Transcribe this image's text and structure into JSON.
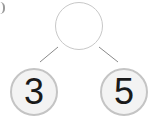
{
  "diagram": {
    "type": "number-bond",
    "top": {
      "value": ""
    },
    "parts": [
      {
        "value": "3"
      },
      {
        "value": "5"
      }
    ],
    "colors": {
      "leaf_fill": "#f3f3f3",
      "leaf_border": "#c4c4c4",
      "line": "#8a8a8a"
    }
  }
}
